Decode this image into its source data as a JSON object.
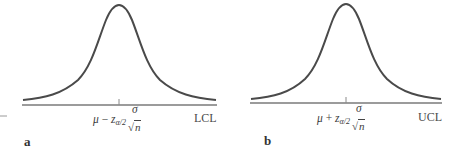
{
  "figure": {
    "panels": [
      {
        "id": "a",
        "panel_label": "a",
        "limit_label": "LCL",
        "formula": {
          "mu": "μ",
          "op": " − ",
          "z": "z",
          "z_sub": "α/2",
          "num": "σ",
          "radical": "√",
          "den": "n"
        }
      },
      {
        "id": "b",
        "panel_label": "b",
        "limit_label": "UCL",
        "formula": {
          "mu": "μ",
          "op": " + ",
          "z": "z",
          "z_sub": "α/2",
          "num": "σ",
          "radical": "√",
          "den": "n"
        }
      }
    ],
    "colors": {
      "curve": "#4a4a4a",
      "axis": "#7a7a7a",
      "text": "#444444"
    }
  }
}
